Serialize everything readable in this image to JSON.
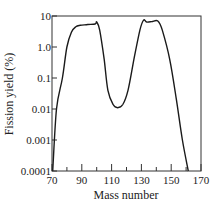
{
  "chart_data": {
    "type": "line",
    "title": "",
    "xlabel": "Mass number",
    "ylabel": "Fission yield (%)",
    "xlim": [
      70,
      170
    ],
    "ylim": [
      0.0001,
      10
    ],
    "yscale": "log",
    "grid": false,
    "legend": null,
    "x_ticks": [
      70,
      90,
      110,
      130,
      150,
      170
    ],
    "x_minor_ticks": [
      80,
      100,
      120,
      140,
      160
    ],
    "y_ticks": [
      10,
      1.0,
      0.1,
      0.01,
      0.001,
      0.0001
    ],
    "y_tick_labels": [
      "10",
      "1.0",
      "0.1",
      "0.01",
      "0.001",
      "0.0001"
    ],
    "series": [
      {
        "name": "Fission yield",
        "x": [
          70.5,
          73,
          77,
          80,
          83,
          86,
          89,
          94,
          99,
          100,
          102,
          105,
          107.5,
          111,
          114,
          117.5,
          121,
          125,
          129,
          131.5,
          133.5,
          137,
          141,
          144,
          149,
          153.5,
          157.5,
          161.5
        ],
        "y": [
          0.0001,
          0.01,
          0.1,
          1.0,
          3.0,
          4.5,
          5.0,
          5.3,
          5.5,
          6.4,
          3.5,
          0.4,
          0.04,
          0.014,
          0.011,
          0.014,
          0.04,
          0.4,
          3.5,
          7.4,
          6.4,
          6.6,
          6.9,
          3.5,
          0.4,
          0.02,
          0.001,
          0.0001
        ]
      }
    ]
  },
  "labels": {
    "xlabel": "Mass number",
    "ylabel": "Fission yield (%)",
    "x_tick_labels": [
      "70",
      "90",
      "110",
      "130",
      "150",
      "170"
    ],
    "y_tick_labels": [
      "10",
      "1.0",
      "0.1",
      "0.01",
      "0.001",
      "0.0001"
    ]
  },
  "colors": {
    "line": "#1a1a1a",
    "frame": "#333333",
    "text": "#222222"
  }
}
